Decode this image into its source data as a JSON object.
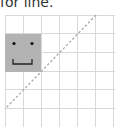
{
  "caption": "for line.",
  "diagram": {
    "grid": {
      "cols": 6,
      "rows": 6,
      "cell_size": 18.5,
      "origin_x": 5,
      "origin_y": 15,
      "line_color": "#d9d9d9"
    },
    "face": {
      "col": 0,
      "row": 1,
      "span_cols": 2,
      "span_rows": 2,
      "fill": "#b3b3b3",
      "features": [
        "left-eye",
        "right-eye",
        "mouth"
      ]
    },
    "diagonal": {
      "from": [
        96,
        15
      ],
      "to": [
        5,
        109
      ],
      "style": "dashed",
      "color": "#aaaaaa"
    }
  }
}
